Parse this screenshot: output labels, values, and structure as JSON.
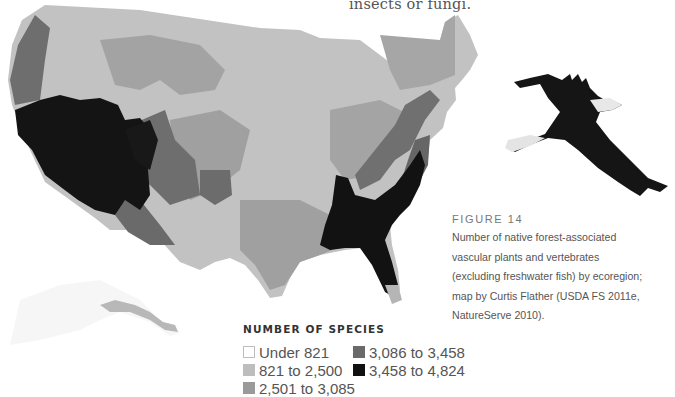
{
  "intro_fragment": "insects or fungi.",
  "figure": {
    "label": "FIGURE 14",
    "caption_lines": [
      "Number of native forest-associated",
      "vascular plants and vertebrates",
      "(excluding freshwater fish) by ecoregion;",
      "map by Curtis Flather (USDA FS 2011e,",
      "NatureServe 2010)."
    ]
  },
  "legend": {
    "title": "NUMBER OF SPECIES",
    "items": [
      {
        "label": "Under 821",
        "color": "#ffffff",
        "border": "#bdbdbd"
      },
      {
        "label": "821 to 2,500",
        "color": "#bdbdbd",
        "border": "#bdbdbd"
      },
      {
        "label": "2,501 to 3,085",
        "color": "#9a9a9a",
        "border": "#9a9a9a"
      },
      {
        "label": "3,086 to 3,458",
        "color": "#6a6a6a",
        "border": "#6a6a6a"
      },
      {
        "label": "3,458 to 4,824",
        "color": "#111111",
        "border": "#111111"
      }
    ]
  },
  "map": {
    "subject": "Contiguous United States and Alaska ecoregions",
    "colors": {
      "class1": "#ffffff",
      "class2": "#c2c2c2",
      "class3": "#a0a0a0",
      "class4": "#6e6e6e",
      "class5": "#141414"
    }
  },
  "image": {
    "subject": "bald-eagle-in-flight"
  }
}
